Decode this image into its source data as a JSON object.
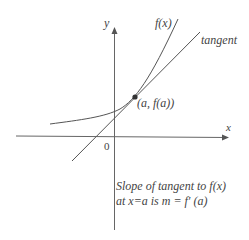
{
  "labels": {
    "y_axis": "y",
    "x_axis": "x",
    "origin": "0",
    "curve": "f(x)",
    "tangent": "tangent",
    "point": "(a, f(a))",
    "caption_line1": "Slope of tangent to f(x)",
    "caption_line2": "at x=a is m = f′ (a)"
  },
  "colors": {
    "line": "#555555",
    "text": "#444444"
  }
}
